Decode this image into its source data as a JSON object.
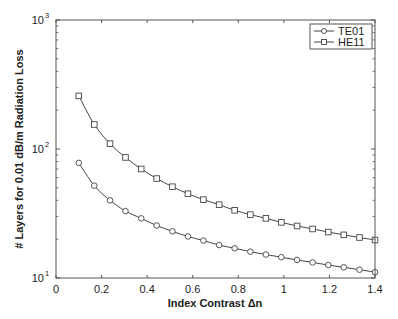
{
  "chart_data": {
    "type": "line",
    "title": "",
    "xlabel": "Index Contrast Δn",
    "ylabel": "# Layers for 0.01 dB/m Radiation Loss",
    "xlim": [
      0,
      1.4
    ],
    "ylim": [
      10,
      1000
    ],
    "yscale": "log",
    "grid": false,
    "legend_position": "upper right",
    "x_ticks": [
      "0",
      "0.2",
      "0.4",
      "0.6",
      "0.8",
      "1",
      "1.2",
      "1.4"
    ],
    "y_ticks": [
      {
        "base": "10",
        "exp": "1"
      },
      {
        "base": "10",
        "exp": "2"
      },
      {
        "base": "10",
        "exp": "3"
      }
    ],
    "x": [
      0.1,
      0.168,
      0.237,
      0.305,
      0.374,
      0.442,
      0.511,
      0.579,
      0.647,
      0.716,
      0.784,
      0.853,
      0.921,
      0.989,
      1.058,
      1.126,
      1.195,
      1.263,
      1.332,
      1.4
    ],
    "series": [
      {
        "name": "TE01",
        "marker": "circle",
        "values": [
          78,
          52,
          40,
          33,
          29,
          25.5,
          23,
          21,
          19.5,
          18,
          17,
          16,
          15.2,
          14.5,
          13.8,
          13.2,
          12.6,
          12.1,
          11.6,
          11.1
        ]
      },
      {
        "name": "HE11",
        "marker": "square",
        "values": [
          258,
          155,
          110,
          86,
          70,
          59,
          51,
          45,
          40.5,
          37,
          33.5,
          31,
          29,
          27,
          25.3,
          24,
          22.7,
          21.6,
          20.6,
          19.7
        ]
      }
    ]
  },
  "legend": {
    "items": [
      {
        "label": "TE01",
        "marker": "circle"
      },
      {
        "label": "HE11",
        "marker": "square"
      }
    ]
  },
  "colors": {
    "axis": "#555555",
    "line": "#444444",
    "marker_fill": "#ffffff"
  }
}
